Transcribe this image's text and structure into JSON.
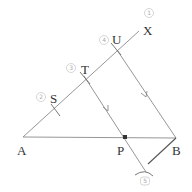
{
  "diagram": {
    "type": "geometric-construction",
    "points": {
      "A": {
        "label": "A",
        "x": 23,
        "y": 137
      },
      "B": {
        "label": "B",
        "x": 176,
        "y": 138
      },
      "P": {
        "label": "P",
        "x": 125,
        "y": 137
      },
      "S": {
        "label": "S",
        "x": 55,
        "y": 110
      },
      "T": {
        "label": "T",
        "x": 86,
        "y": 79
      },
      "U": {
        "label": "U",
        "x": 117,
        "y": 50
      },
      "X": {
        "label": "X",
        "x": 138,
        "y": 31
      }
    },
    "step_numbers": [
      {
        "n": "1",
        "x": 149,
        "y": 15
      },
      {
        "n": "4",
        "x": 104,
        "y": 41
      },
      {
        "n": "3",
        "x": 71,
        "y": 69
      },
      {
        "n": "2",
        "x": 41,
        "y": 98
      },
      {
        "n": "5",
        "x": 145,
        "y": 182
      }
    ],
    "edges": [
      {
        "from": "A",
        "to": "X",
        "name": "ray-AX"
      },
      {
        "from": "A",
        "to": "B",
        "name": "segment-AB"
      },
      {
        "from": "U",
        "to": "B",
        "name": "segment-UB",
        "arrow": true
      },
      {
        "from": "T",
        "to": "P",
        "name": "segment-TP",
        "arrow": true
      }
    ],
    "point_labels": {
      "A": "A",
      "B": "B",
      "P": "P",
      "S": "S",
      "T": "T",
      "U": "U",
      "X": "X"
    },
    "step_labels": [
      "1",
      "2",
      "3",
      "4",
      "5"
    ]
  }
}
